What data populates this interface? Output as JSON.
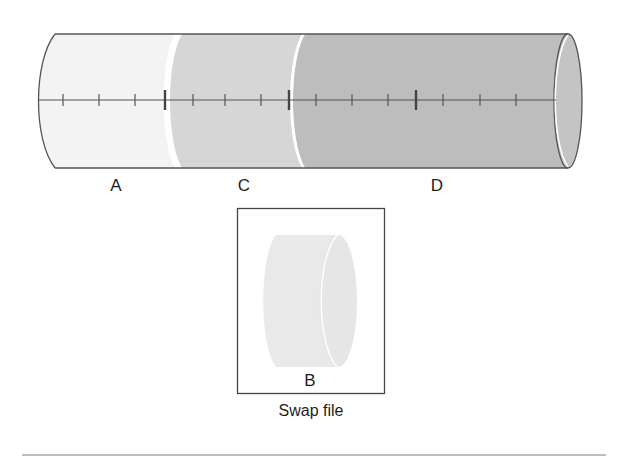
{
  "diagram": {
    "colors": {
      "segment_a": "#f3f3f3",
      "segment_c": "#d6d6d6",
      "segment_d": "#bdbdbd",
      "end_cap": "#c4c4c4",
      "swap_cylinder": "#e9e9e9",
      "outline": "#555555",
      "rule": "#bdbdbd"
    },
    "cylinder": {
      "segments": [
        {
          "id": "A",
          "label": "A"
        },
        {
          "id": "C",
          "label": "C"
        },
        {
          "id": "D",
          "label": "D"
        }
      ],
      "ticks": {
        "minor_count": 12,
        "major_count": 3
      }
    },
    "swap": {
      "segment_label": "B",
      "caption": "Swap file"
    }
  }
}
